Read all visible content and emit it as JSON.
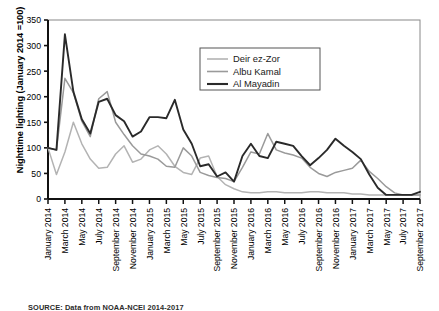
{
  "chart_data": {
    "type": "line",
    "title": "",
    "xlabel": "",
    "ylabel": "Nighttime lighting (January 2014 =100)",
    "ylim": [
      0,
      350
    ],
    "yticks": [
      0,
      50,
      100,
      150,
      200,
      250,
      300,
      350
    ],
    "grid": false,
    "legend_position": "top-center",
    "x": [
      "January 2014",
      "February 2014",
      "March 2014",
      "April 2014",
      "May 2014",
      "June 2014",
      "July 2014",
      "August 2014",
      "September 2014",
      "October 2014",
      "November 2014",
      "December 2014",
      "January 2015",
      "February 2015",
      "March 2015",
      "April 2015",
      "May 2015",
      "June 2015",
      "July 2015",
      "August 2015",
      "September 2015",
      "October 2015",
      "November 2015",
      "December 2015",
      "January 2016",
      "February 2016",
      "March 2016",
      "April 2016",
      "May 2016",
      "June 2016",
      "July 2016",
      "August 2016",
      "September 2016",
      "October 2016",
      "November 2016",
      "December 2016",
      "January 2017",
      "February 2017",
      "March 2017",
      "April 2017",
      "May 2017",
      "June 2017",
      "July 2017",
      "August 2017",
      "September 2017"
    ],
    "xticks": [
      "January 2014",
      "March 2014",
      "May 2014",
      "July 2014",
      "September 2014",
      "November 2014",
      "January 2015",
      "March 2015",
      "May 2015",
      "July 2015",
      "September 2015",
      "November 2015",
      "January 2016",
      "March 2016",
      "May 2016",
      "July 2016",
      "September 2016",
      "November 2016",
      "January 2017",
      "March 2017",
      "May 2017",
      "July 2017",
      "September 2017"
    ],
    "series": [
      {
        "name": "Deir ez-Zor",
        "color": "#b3b3b3",
        "values": [
          100,
          48,
          92,
          150,
          108,
          78,
          60,
          62,
          88,
          104,
          72,
          78,
          96,
          104,
          88,
          64,
          52,
          48,
          80,
          84,
          44,
          28,
          20,
          14,
          12,
          12,
          14,
          14,
          12,
          12,
          12,
          14,
          14,
          12,
          12,
          12,
          10,
          10,
          8,
          8,
          8,
          8,
          8,
          8,
          8
        ]
      },
      {
        "name": "Albu Kamal",
        "color": "#9a9a9a",
        "values": [
          100,
          96,
          236,
          208,
          152,
          122,
          196,
          210,
          150,
          126,
          104,
          88,
          84,
          78,
          64,
          62,
          100,
          84,
          52,
          46,
          42,
          40,
          34,
          62,
          92,
          88,
          128,
          96,
          90,
          86,
          80,
          62,
          50,
          44,
          52,
          56,
          60,
          76,
          54,
          40,
          24,
          12,
          8,
          8,
          8
        ]
      },
      {
        "name": "Al Mayadin",
        "color": "#2a2a2a",
        "values": [
          100,
          96,
          322,
          210,
          156,
          128,
          190,
          196,
          164,
          152,
          122,
          132,
          160,
          160,
          158,
          194,
          136,
          108,
          64,
          68,
          44,
          52,
          34,
          84,
          108,
          84,
          80,
          112,
          108,
          104,
          84,
          66,
          80,
          96,
          118,
          104,
          92,
          78,
          48,
          22,
          8,
          8,
          8,
          8,
          14
        ]
      }
    ]
  },
  "legend": {
    "items": [
      {
        "label": "Deir ez-Zor"
      },
      {
        "label": "Albu Kamal"
      },
      {
        "label": "Al Mayadin"
      }
    ]
  },
  "source": {
    "text": "SOURCE: Data from NOAA-NCEI 2014-2017"
  }
}
